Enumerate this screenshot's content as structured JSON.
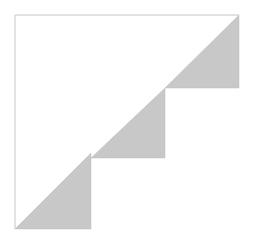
{
  "figure": {
    "colors": {
      "background": "#ffffff",
      "frame": "#d8d8d8",
      "fill": "#c8c8c8",
      "fill_edge": "#bdbdbd"
    },
    "frame": {
      "left_x": 15,
      "top_y": 15,
      "right_x": 239,
      "bottom_y": 229
    },
    "triangles": [
      {
        "name": "step-1",
        "points": [
          [
            15,
            229
          ],
          [
            91,
            153
          ],
          [
            91,
            229
          ]
        ]
      },
      {
        "name": "step-2",
        "points": [
          [
            91,
            158
          ],
          [
            165,
            88
          ],
          [
            165,
            158
          ]
        ]
      },
      {
        "name": "step-3",
        "points": [
          [
            165,
            88
          ],
          [
            239,
            15
          ],
          [
            239,
            88
          ]
        ]
      }
    ]
  }
}
